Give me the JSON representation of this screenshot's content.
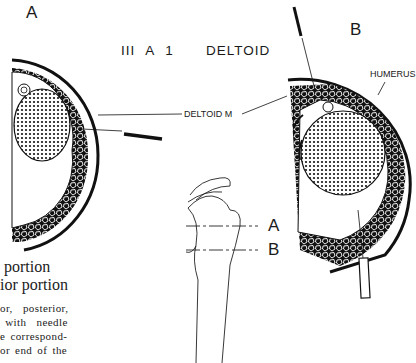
{
  "figure": {
    "title": "III A 1   DELTOID",
    "panels": [
      {
        "id": "A",
        "label": "A"
      },
      {
        "id": "B",
        "label": "B"
      }
    ],
    "annotations": {
      "deltoid_muscle": "DELTOID M",
      "humerus": "HUMERUS"
    },
    "section_levels": [
      {
        "label": "A"
      },
      {
        "label": "B"
      }
    ]
  },
  "caption": {
    "lines_head": [
      " portion",
      "ior portion"
    ],
    "lines_body": [
      "or,  posterior,",
      " with  needle",
      "e correspond-",
      "or end of the"
    ]
  }
}
